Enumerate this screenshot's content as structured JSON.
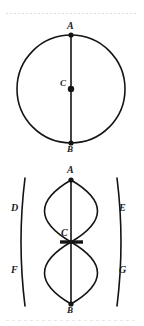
{
  "figure": {
    "caption_top": "",
    "caption_bottom": "",
    "stroke_color": "#141414",
    "label_color": "#1a1a1a",
    "background_color": "#ffffff",
    "scan_line_color": "#cfcfd6"
  },
  "diagrams": [
    {
      "id": "circle-with-diameter",
      "name": "Circle with diameter AB and centre C",
      "type": "circle",
      "center": {
        "x": 71,
        "y": 89
      },
      "radius": 54,
      "points": [
        {
          "label": "A",
          "x": 71,
          "y": 35,
          "role": "endpoint-of-diameter",
          "marker": "dot"
        },
        {
          "label": "C",
          "x": 71,
          "y": 89,
          "role": "centre",
          "marker": "dot"
        },
        {
          "label": "B",
          "x": 71,
          "y": 143,
          "role": "endpoint-of-diameter",
          "marker": "dot"
        }
      ],
      "segments": [
        {
          "from": "A",
          "to": "B",
          "kind": "diameter"
        }
      ],
      "label_positions": [
        {
          "label": "A",
          "x": 67,
          "y": 22
        },
        {
          "label": "C",
          "x": 60,
          "y": 80
        },
        {
          "label": "B",
          "x": 67,
          "y": 146
        }
      ]
    },
    {
      "id": "compass-construction",
      "name": "Compass arc construction of perpendicular bisector",
      "type": "arc-construction",
      "points": [
        {
          "label": "A",
          "x": 71,
          "y": 180,
          "role": "arc-centre-upper",
          "marker": "dot"
        },
        {
          "label": "C",
          "x": 71,
          "y": 242,
          "role": "midpoint",
          "marker": "tick"
        },
        {
          "label": "B",
          "x": 71,
          "y": 304,
          "role": "arc-centre-lower",
          "marker": "dot"
        },
        {
          "label": "D",
          "x": 31,
          "y": 211,
          "role": "arc-intersection",
          "marker": "none"
        },
        {
          "label": "E",
          "x": 111,
          "y": 211,
          "role": "arc-intersection",
          "marker": "none"
        },
        {
          "label": "F",
          "x": 31,
          "y": 273,
          "role": "arc-intersection",
          "marker": "none"
        },
        {
          "label": "G",
          "x": 111,
          "y": 273,
          "role": "arc-intersection",
          "marker": "none"
        }
      ],
      "segments": [
        {
          "from": "A",
          "to": "B",
          "kind": "line"
        }
      ],
      "label_positions": [
        {
          "label": "A",
          "x": 67,
          "y": 166
        },
        {
          "label": "D",
          "x": 13,
          "y": 204
        },
        {
          "label": "E",
          "x": 116,
          "y": 204
        },
        {
          "label": "C",
          "x": 60,
          "y": 231
        },
        {
          "label": "F",
          "x": 13,
          "y": 266
        },
        {
          "label": "G",
          "x": 116,
          "y": 266
        },
        {
          "label": "B",
          "x": 67,
          "y": 307
        }
      ]
    }
  ],
  "labels": {
    "A": "A",
    "B": "B",
    "C": "C",
    "D": "D",
    "E": "E",
    "F": "F",
    "G": "G"
  }
}
